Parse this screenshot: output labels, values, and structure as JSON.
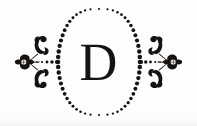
{
  "plate": {
    "kind": "printers-ornament-vignette",
    "description": "Decorative typographic vignette: dotted oval cartouche enclosing a serif capital letter, flanked by mirrored floral fleuron flourishes joined by tapering dotted rules.",
    "background_color": "#fdfdfd",
    "ink_color": "#16120f",
    "width": 197,
    "height": 126
  },
  "initial": {
    "letter": "D",
    "style": "roman-serif-capital",
    "color": "#16120f"
  },
  "cartouche": {
    "label": "dotted oval frame",
    "shape": "pointed-oval",
    "center_x": 99,
    "center_y": 62,
    "half_width": 41,
    "half_height": 53,
    "dot_count": 56,
    "dot_radius_min": 1.05,
    "dot_radius_max": 2.25,
    "color": "#16120f"
  },
  "connectors": [
    {
      "label": "left dotted connector",
      "from_x": 37,
      "to_x": 57,
      "y": 62,
      "dot_count": 5,
      "dot_radius_min": 0.85,
      "dot_radius_max": 2.1
    },
    {
      "label": "right dotted connector",
      "from_x": 160,
      "to_x": 141,
      "y": 62,
      "dot_count": 5,
      "dot_radius_min": 0.85,
      "dot_radius_max": 2.1
    }
  ],
  "flourishes": [
    {
      "label": "left floral fleuron",
      "side": "left",
      "anchor_x": 24,
      "anchor_y": 62,
      "parts": [
        "rosette",
        "upper-scroll-curl",
        "lower-scroll-curl",
        "stem-rule"
      ]
    },
    {
      "label": "right floral fleuron",
      "side": "right",
      "anchor_x": 173,
      "anchor_y": 62,
      "parts": [
        "rosette",
        "upper-scroll-curl",
        "lower-scroll-curl",
        "stem-rule"
      ]
    }
  ]
}
